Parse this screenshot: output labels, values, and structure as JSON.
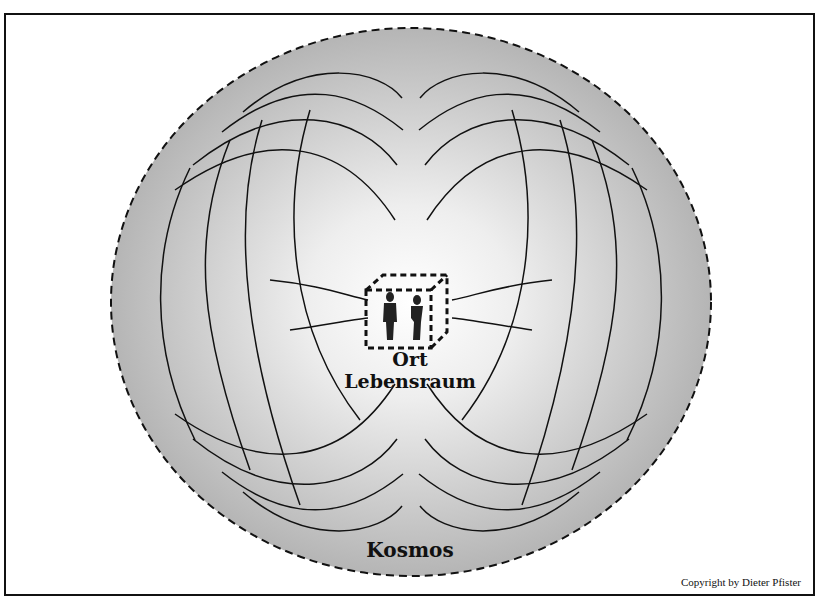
{
  "figure": {
    "labels": {
      "center_title": "Ort",
      "center_subtitle": "Lebensraum",
      "outer": "Kosmos"
    },
    "copyright": "Copyright by Dieter Pfister",
    "icons": {
      "center": "dashed-cube-with-two-people-icon"
    },
    "colors": {
      "fill_outer": "#b9b9b9",
      "fill_center": "#ffffff",
      "stroke": "#111111"
    }
  }
}
